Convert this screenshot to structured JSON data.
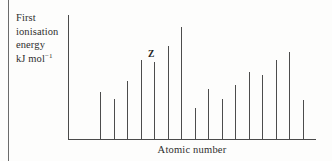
{
  "chart_data": {
    "type": "bar",
    "title": "",
    "subtitle": "",
    "ylabel": "First ionisation energy kJ mol⁻¹",
    "xlabel": "Atomic number",
    "grid": false,
    "legend": null,
    "axis_ranges": {
      "x": [
        0,
        17
      ],
      "y": [
        0,
        100
      ]
    },
    "tick_labels": {
      "x": [],
      "y": []
    },
    "categories": [
      "1",
      "2",
      "3",
      "4",
      "5",
      "6",
      "7",
      "8",
      "9",
      "10",
      "11",
      "12",
      "13",
      "14",
      "15",
      "16"
    ],
    "values": [
      39,
      33,
      48,
      65,
      64,
      77,
      93,
      26,
      41,
      33,
      45,
      55,
      53,
      65,
      72,
      32
    ],
    "annotations": [
      {
        "text": "Z",
        "at_category": "5",
        "note": "label above fifth bar"
      }
    ]
  },
  "labels": {
    "y_axis_line1": "First",
    "y_axis_line2": "ionisation",
    "y_axis_line3": "energy",
    "y_axis_line4_main": "kJ mol",
    "y_axis_line4_sup": "−1",
    "x_axis": "Atomic number",
    "annotation_z": "Z"
  },
  "colors": {
    "bar": "#4c4c4c",
    "axis": "#4a4a4a",
    "text": "#2e2e2e",
    "background": "#fdfdfc",
    "page_edge": "#6b6b6b"
  }
}
